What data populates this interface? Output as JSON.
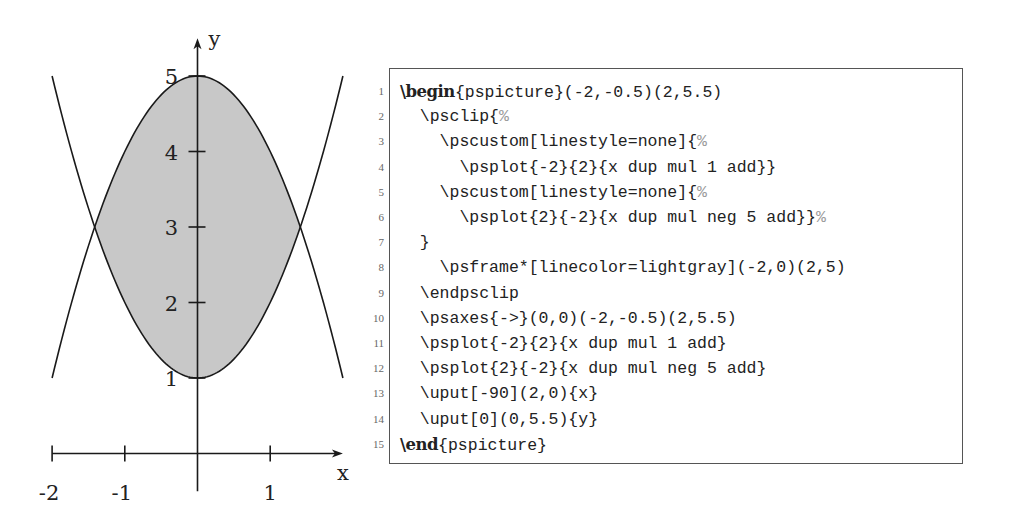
{
  "figure": {
    "axis_labels": {
      "x": "x",
      "y": "y"
    },
    "x_tick_labels": [
      "-2",
      "-1",
      "1"
    ],
    "y_tick_labels": [
      "1",
      "2",
      "3",
      "4",
      "5"
    ],
    "fill_color": "#c8c8c8",
    "line_color": "#1a1a1a"
  },
  "chart_data": {
    "type": "area",
    "title": "",
    "xlabel": "x",
    "ylabel": "y",
    "xlim": [
      -2,
      2
    ],
    "ylim": [
      -0.5,
      5.5
    ],
    "x_ticks": [
      -2,
      -1,
      1
    ],
    "y_ticks": [
      1,
      2,
      3,
      4,
      5
    ],
    "grid": false,
    "series": [
      {
        "name": "y = x^2 + 1",
        "x": [
          -2,
          -1.5,
          -1,
          -0.5,
          0,
          0.5,
          1,
          1.5,
          2
        ],
        "values": [
          5,
          3.25,
          2,
          1.25,
          1,
          1.25,
          2,
          3.25,
          5
        ]
      },
      {
        "name": "y = 5 - x^2",
        "x": [
          -2,
          -1.5,
          -1,
          -0.5,
          0,
          0.5,
          1,
          1.5,
          2
        ],
        "values": [
          1,
          2.75,
          4,
          4.75,
          5,
          4.75,
          4,
          2.75,
          1
        ]
      }
    ],
    "shaded_region": {
      "description": "region between y=x^2+1 and y=5-x^2 clipped to frame (-2,0)(2,5)",
      "color": "lightgray",
      "intersections": [
        [
          -1.414,
          3
        ],
        [
          1.414,
          3
        ]
      ]
    }
  },
  "code": {
    "lines": [
      {
        "no": "1",
        "parts": [
          {
            "t": "\\begin",
            "k": "kw"
          },
          {
            "t": "{pspicture}(-2,-0.5)(2,5.5)",
            "k": ""
          }
        ]
      },
      {
        "no": "2",
        "parts": [
          {
            "t": "  \\psclip{",
            "k": ""
          },
          {
            "t": "%",
            "k": "cm"
          }
        ]
      },
      {
        "no": "3",
        "parts": [
          {
            "t": "    \\pscustom[linestyle=none]{",
            "k": ""
          },
          {
            "t": "%",
            "k": "cm"
          }
        ]
      },
      {
        "no": "4",
        "parts": [
          {
            "t": "      \\psplot{-2}{2}{x dup mul 1 add}}",
            "k": ""
          }
        ]
      },
      {
        "no": "5",
        "parts": [
          {
            "t": "    \\pscustom[linestyle=none]{",
            "k": ""
          },
          {
            "t": "%",
            "k": "cm"
          }
        ]
      },
      {
        "no": "6",
        "parts": [
          {
            "t": "      \\psplot{2}{-2}{x dup mul neg 5 add}}",
            "k": ""
          },
          {
            "t": "%",
            "k": "cm"
          }
        ]
      },
      {
        "no": "7",
        "parts": [
          {
            "t": "  }",
            "k": ""
          }
        ]
      },
      {
        "no": "8",
        "parts": [
          {
            "t": "    \\psframe*[linecolor=lightgray](-2,0)(2,5)",
            "k": ""
          }
        ]
      },
      {
        "no": "9",
        "parts": [
          {
            "t": "  \\endpsclip",
            "k": ""
          }
        ]
      },
      {
        "no": "10",
        "parts": [
          {
            "t": "  \\psaxes{->}(0,0)(-2,-0.5)(2,5.5)",
            "k": ""
          }
        ]
      },
      {
        "no": "11",
        "parts": [
          {
            "t": "  \\psplot{-2}{2}{x dup mul 1 add}",
            "k": ""
          }
        ]
      },
      {
        "no": "12",
        "parts": [
          {
            "t": "  \\psplot{2}{-2}{x dup mul neg 5 add}",
            "k": ""
          }
        ]
      },
      {
        "no": "13",
        "parts": [
          {
            "t": "  \\uput[-90](2,0){x}",
            "k": ""
          }
        ]
      },
      {
        "no": "14",
        "parts": [
          {
            "t": "  \\uput[0](0,5.5){y}",
            "k": ""
          }
        ]
      },
      {
        "no": "15",
        "parts": [
          {
            "t": "\\end",
            "k": "kw"
          },
          {
            "t": "{pspicture}",
            "k": ""
          }
        ]
      }
    ]
  }
}
